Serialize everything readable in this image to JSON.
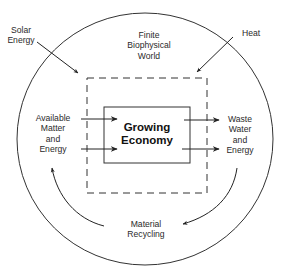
{
  "diagram": {
    "world": {
      "label": "Finite\nBiophysical\nWorld"
    },
    "economy": {
      "label": "Growing\nEconomy"
    },
    "inputs": {
      "solar": {
        "label": "Solar\nEnergy"
      },
      "available": {
        "label": "Available\nMatter\nand\nEnergy"
      }
    },
    "outputs": {
      "heat": {
        "label": "Heat"
      },
      "waste": {
        "label": "Waste\nWater\nand\nEnergy"
      }
    },
    "recycling": {
      "label": "Material\nRecycling"
    },
    "colors": {
      "line": "#222222",
      "background": "#ffffff"
    },
    "nodes": [
      "Solar Energy",
      "Finite Biophysical World",
      "Heat",
      "Available Matter and Energy",
      "Growing Economy",
      "Waste Water and Energy",
      "Material Recycling"
    ],
    "edges": [
      {
        "from": "Solar Energy",
        "to": "Growing Economy boundary"
      },
      {
        "from": "Growing Economy boundary",
        "to": "Heat"
      },
      {
        "from": "Available Matter and Energy",
        "to": "Growing Economy",
        "count": 2
      },
      {
        "from": "Growing Economy",
        "to": "Waste Water and Energy",
        "count": 2
      },
      {
        "from": "Waste Water and Energy",
        "to": "Material Recycling"
      },
      {
        "from": "Material Recycling",
        "to": "Available Matter and Energy"
      }
    ]
  }
}
